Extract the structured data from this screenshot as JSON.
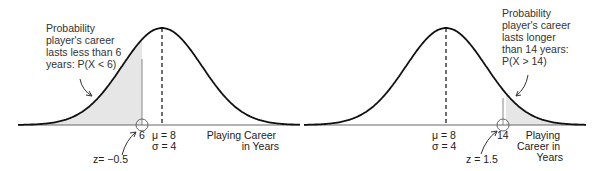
{
  "chart_data": [
    {
      "type": "area",
      "title": "Normal distribution, left tail",
      "distribution": "normal",
      "mean": 8,
      "sd": 4,
      "shaded_region": "X < 6",
      "cutoff": 6,
      "z": -0.5,
      "xlabel": "Playing Career in Years",
      "annotation": "Probability player's career lasts less than 6 years: P(X < 6)",
      "grid": false
    },
    {
      "type": "area",
      "title": "Normal distribution, right tail",
      "distribution": "normal",
      "mean": 8,
      "sd": 4,
      "shaded_region": "X > 14",
      "cutoff": 14,
      "z": 1.5,
      "xlabel": "Playing Career in Years",
      "annotation": "Probability player's career lasts longer than 14 years: P(X > 14)",
      "grid": false
    }
  ],
  "left": {
    "annotation_lines": [
      "Probability",
      "player's career",
      "lasts less than 6",
      "years: P(X < 6)"
    ],
    "cutoff_label": "6",
    "mu_label": "μ = 8",
    "sigma_label": "σ = 4",
    "z_label": "z= −0.5",
    "xlabel_lines": [
      "Playing Career",
      "in Years"
    ]
  },
  "right": {
    "annotation_lines": [
      "Probability",
      "player's career",
      "lasts longer",
      "than 14 years:",
      "P(X > 14)"
    ],
    "cutoff_label": "14",
    "mu_label": "μ = 8",
    "sigma_label": "σ = 4",
    "z_label": "z = 1.5",
    "xlabel_lines": [
      "Playing",
      "Career in",
      "Years"
    ]
  },
  "colors": {
    "curve": "#111111",
    "shade": "#e6e6e6",
    "axis": "#555555"
  }
}
